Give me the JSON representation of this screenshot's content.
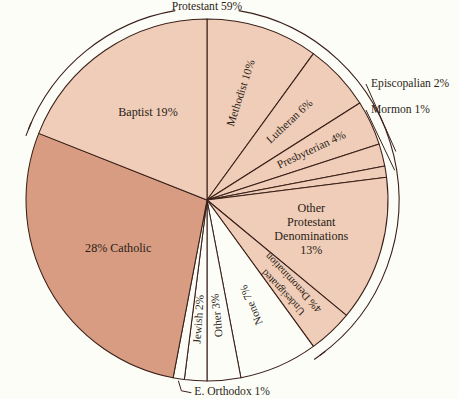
{
  "chart_data": {
    "type": "pie",
    "title": "",
    "subtitle": "",
    "xlabel": "",
    "ylabel": "",
    "legend_position": "none",
    "grid": false,
    "units": "percent",
    "total": 100,
    "start_angle_deg": 0,
    "direction": "clockwise",
    "categories": [
      "Methodist",
      "Lutheran",
      "Presbyterian",
      "Episcopalian",
      "Mormon",
      "Other Protestant Denominations",
      "Denomination Undesignated",
      "None",
      "Other",
      "Jewish",
      "E. Orthodox",
      "Catholic",
      "Baptist"
    ],
    "values": [
      10,
      6,
      4,
      2,
      1,
      13,
      4,
      7,
      3,
      2,
      1,
      28,
      19
    ],
    "groups": [
      {
        "name": "Protestant",
        "value": 59,
        "members": [
          "Methodist",
          "Lutheran",
          "Presbyterian",
          "Episcopalian",
          "Mormon",
          "Other Protestant Denominations",
          "Denomination Undesignated",
          "Baptist"
        ]
      }
    ],
    "slices": [
      {
        "key": "methodist",
        "label": "Methodist 10%",
        "name": "Methodist",
        "value": 10,
        "fill": "#efcdb9",
        "label_mode": "radial",
        "label_r": 0.62,
        "label_flip": false
      },
      {
        "key": "lutheran",
        "label": "Lutheran 6%",
        "name": "Lutheran",
        "value": 6,
        "fill": "#efcdb9",
        "label_mode": "radial",
        "label_r": 0.62,
        "label_flip": false
      },
      {
        "key": "presbyterian",
        "label": "Presbyterian 4%",
        "name": "Presbyterian",
        "value": 4,
        "fill": "#efcdb9",
        "label_mode": "radial",
        "label_r": 0.62,
        "label_flip": false
      },
      {
        "key": "episcopalian",
        "label": "Episcopalian 2%",
        "name": "Episcopalian",
        "value": 2,
        "fill": "#efcdb9",
        "label_mode": "external",
        "label_r": 0.0,
        "label_flip": false
      },
      {
        "key": "mormon",
        "label": "Mormon 1%",
        "name": "Mormon",
        "value": 1,
        "fill": "#efcdb9",
        "label_mode": "external",
        "label_r": 0.0,
        "label_flip": false
      },
      {
        "key": "other-prot",
        "label": "Other Protestant Denominations 13%",
        "name": "Other Protestant Denominations",
        "value": 13,
        "fill": "#efcdb9",
        "label_mode": "horizontal",
        "label_r": 0.62,
        "label_flip": false
      },
      {
        "key": "undesignated",
        "label": "4% Denomination Undesignated",
        "name": "Denomination Undesignated",
        "value": 4,
        "fill": "#efcdb9",
        "label_mode": "radial",
        "label_r": 0.6,
        "label_flip": true
      },
      {
        "key": "none",
        "label": "None 7%",
        "name": "None",
        "value": 7,
        "fill": "#fdfdf8",
        "label_mode": "radial",
        "label_r": 0.62,
        "label_flip": true
      },
      {
        "key": "other",
        "label": "Other 3%",
        "name": "Other",
        "value": 3,
        "fill": "#fdfdf8",
        "label_mode": "radial",
        "label_r": 0.62,
        "label_flip": true
      },
      {
        "key": "jewish",
        "label": "Jewish 2%",
        "name": "Jewish",
        "value": 2,
        "fill": "#fdfdf8",
        "label_mode": "radial",
        "label_r": 0.62,
        "label_flip": true
      },
      {
        "key": "e-orthodox",
        "label": "E. Orthodox 1%",
        "name": "E. Orthodox",
        "value": 1,
        "fill": "#fdfdf8",
        "label_mode": "external",
        "label_r": 0.0,
        "label_flip": false
      },
      {
        "key": "catholic",
        "label": "28% Catholic",
        "name": "Catholic",
        "value": 28,
        "fill": "#d89c82",
        "label_mode": "horizontal",
        "label_r": 0.58,
        "label_flip": false
      },
      {
        "key": "baptist",
        "label": "Baptist 19%",
        "name": "Baptist",
        "value": 19,
        "fill": "#efcdb9",
        "label_mode": "horizontal",
        "label_r": 0.6,
        "label_flip": false
      }
    ],
    "annotations": [
      {
        "key": "protestant-bracket",
        "label": "Protestant 59%",
        "type": "group-bracket",
        "value": 59
      }
    ]
  },
  "colors": {
    "background": "#fdfdf8",
    "protestant_fill": "#efcdb9",
    "catholic_fill": "#d89c82",
    "unfilled": "#fdfdf8",
    "outline": "#3a2018",
    "text": "#2b1d16"
  },
  "labels": {
    "protestant_bracket": "Protestant 59%",
    "methodist": "Methodist 10%",
    "lutheran": "Lutheran 6%",
    "presbyterian": "Presbyterian 4%",
    "episcopalian": "Episcopalian 2%",
    "mormon": "Mormon 1%",
    "other_protestant_l1": "Other",
    "other_protestant_l2": "Protestant",
    "other_protestant_l3": "Denominations",
    "other_protestant_l4": "13%",
    "undesignated_l1": "4% Denomination",
    "undesignated_l2": "Undesignated",
    "none": "None 7%",
    "other": "Other 3%",
    "jewish": "Jewish 2%",
    "e_orthodox": "E. Orthodox  1%",
    "catholic": "28% Catholic",
    "baptist": "Baptist 19%"
  }
}
